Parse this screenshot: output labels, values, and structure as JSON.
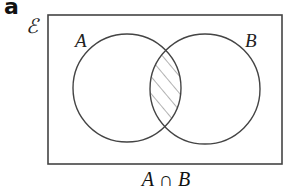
{
  "panel_label": "a",
  "universe_symbol": "ℰ",
  "sets": [
    {
      "label": "A",
      "cx": 127,
      "cy": 88,
      "r": 54
    },
    {
      "label": "B",
      "cx": 205,
      "cy": 89,
      "r": 55
    }
  ],
  "shaded_region": "intersection",
  "caption": "A ∩ B",
  "colors": {
    "stroke": "#444444",
    "hatch": "#666666",
    "background": "#ffffff"
  }
}
